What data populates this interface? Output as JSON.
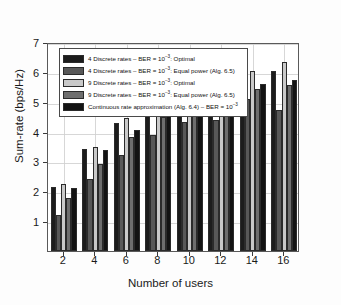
{
  "chart_data": {
    "type": "bar",
    "title": "",
    "xlabel": "Number of users",
    "ylabel": "Sum-rate (bps/Hz)",
    "categories": [
      "2",
      "4",
      "6",
      "8",
      "10",
      "12",
      "14",
      "16"
    ],
    "x": [
      2,
      4,
      6,
      8,
      10,
      12,
      14,
      16
    ],
    "xlim": [
      1,
      17
    ],
    "ylim": [
      0,
      7
    ],
    "yticks": [
      1,
      2,
      3,
      4,
      5,
      6,
      7
    ],
    "xticks": [
      2,
      4,
      6,
      8,
      10,
      12,
      14,
      16
    ],
    "grid": true,
    "legend_position": "upper-left",
    "series": [
      {
        "name": "4 Discrete rates – BER = 10⁻³: Optimal",
        "color": "#1c1c1c",
        "values": [
          2.15,
          3.42,
          4.28,
          4.72,
          5.12,
          5.52,
          5.68,
          6.02
        ]
      },
      {
        "name": "4 Discrete rates – BER = 10⁻³: Equal power (Alg. 6.5)",
        "color": "#585858",
        "values": [
          1.22,
          2.42,
          3.22,
          3.9,
          4.32,
          4.38,
          5.1,
          4.72
        ]
      },
      {
        "name": "9 Discrete rates – BER = 10⁻³: Optimal",
        "color": "#c9c9c9",
        "values": [
          2.26,
          3.5,
          4.44,
          4.98,
          5.36,
          5.78,
          6.02,
          6.34
        ]
      },
      {
        "name": "9 Discrete rates – BER = 10⁻³: Equal power (Alg. 6.5)",
        "color": "#6e6e6e",
        "values": [
          1.78,
          2.92,
          3.82,
          4.5,
          4.8,
          5.02,
          5.42,
          5.56
        ]
      },
      {
        "name": "Continuous rate approximation (Alg. 6.4) – BER = 10⁻³",
        "color": "#131313",
        "values": [
          2.1,
          3.38,
          4.06,
          4.62,
          5.06,
          5.4,
          5.6,
          5.72
        ]
      }
    ]
  },
  "legend": {
    "entries": [
      {
        "pre": "4 Discrete rates – BER = 10",
        "sup": "−3",
        "post": ": Optimal"
      },
      {
        "pre": "4 Discrete rates – BER = 10",
        "sup": "−3",
        "post": ": Equal power (Alg. 6.5)"
      },
      {
        "pre": "9 Discrete rates – BER = 10",
        "sup": "−3",
        "post": ": Optimal"
      },
      {
        "pre": "9 Discrete rates – BER = 10",
        "sup": "−3",
        "post": ": Equal power (Alg. 6.5)"
      },
      {
        "pre": "Continuous rate approximation (Alg. 6.4) – BER = 10",
        "sup": "−3",
        "post": ""
      }
    ]
  }
}
